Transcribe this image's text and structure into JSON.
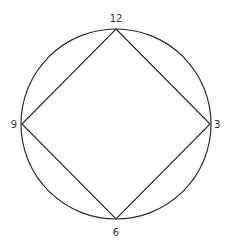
{
  "diagram": {
    "type": "circle-inscribed-square",
    "circle": {
      "cx": 116,
      "cy": 124,
      "r": 95
    },
    "square_vertices": {
      "top": [
        116,
        29
      ],
      "right": [
        210,
        124
      ],
      "bottom": [
        116,
        219
      ],
      "left": [
        22,
        124
      ]
    },
    "labels": {
      "top": "12",
      "right": "3",
      "bottom": "6",
      "left": "9"
    },
    "colors": {
      "stroke": "#2b2b2b",
      "text": "#333333",
      "background": "#ffffff"
    }
  }
}
